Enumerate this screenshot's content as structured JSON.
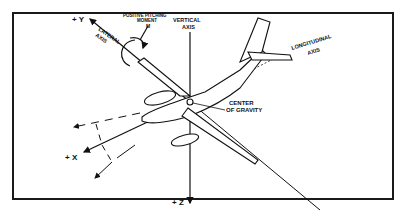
{
  "diagram": {
    "axes": {
      "y": "+ Y",
      "x": "+ X",
      "z": "+ Z",
      "lateral_line1": "LATERAL",
      "lateral_line2": "AXIS",
      "vertical_line1": "VERTICAL",
      "vertical_line2": "AXIS",
      "longitudinal_line1": "LONGITUDINAL",
      "longitudinal_line2": "AXIS"
    },
    "moment": {
      "line1": "POSITIVE PITCHING",
      "line2": "MOMENT",
      "symbol": "M"
    },
    "cg": {
      "line1": "CENTER",
      "line2": "OF GRAVITY"
    },
    "colors": {
      "ink": "#111111",
      "background": "#ffffff"
    }
  }
}
